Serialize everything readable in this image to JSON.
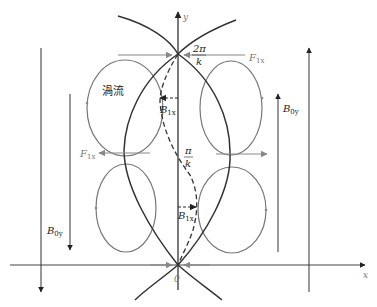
{
  "diagram": {
    "type": "eddy-current-magnetic-field-diagram",
    "axes": {
      "x_label": "x",
      "y_label": "y",
      "origin_label": "0"
    },
    "labels": {
      "two_pi_num": "2π",
      "two_pi_den": "k",
      "pi_num": "π",
      "pi_den": "k",
      "eddy": "渦流",
      "F1x_top": "F",
      "F1x_top_sub": "1x",
      "F1x_mid": "F",
      "F1x_mid_sub": "1x",
      "B1x_upper": "B",
      "B1x_upper_sub": "1x",
      "B1x_lower": "B",
      "B1x_lower_sub": "1x",
      "B0y_left": "B",
      "B0y_left_sub": "0y",
      "B0y_right": "B",
      "B0y_right_sub": "0y"
    },
    "colors": {
      "curve": "#333333",
      "loop": "#777777",
      "arrow": "#222222",
      "force_arrow": "#888888"
    }
  }
}
